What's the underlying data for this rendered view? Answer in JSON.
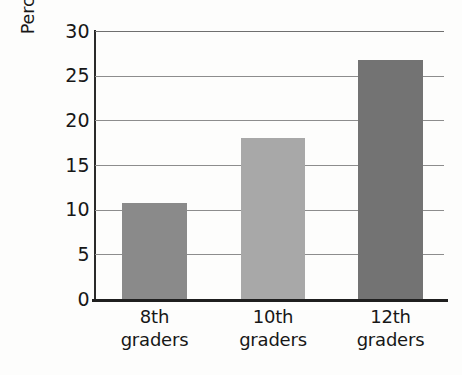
{
  "chart_data": {
    "type": "bar",
    "title": "",
    "subtitle": "",
    "xlabel": "",
    "ylabel": "Percentage smoking regularly",
    "categories": [
      "8th graders",
      "10th graders",
      "12th graders"
    ],
    "category_lines": [
      {
        "line1": "8th",
        "line2": "graders"
      },
      {
        "line1": "10th",
        "line2": "graders"
      },
      {
        "line1": "12th",
        "line2": "graders"
      }
    ],
    "values": [
      10.7,
      18.0,
      26.7
    ],
    "bar_colors": [
      "#8a8a8a",
      "#a8a8a8",
      "#737373"
    ],
    "ylim": [
      0,
      30
    ],
    "ytick_labels": [
      "30",
      "25",
      "20",
      "15",
      "10",
      "5",
      "0"
    ],
    "ytick_values": [
      30,
      25,
      20,
      15,
      10,
      5,
      0
    ],
    "grid": "horizontal",
    "legend": "none",
    "gridline_color": "#8d8d8d",
    "axis_color": "#1f1f1f",
    "background": "#fdfdfc"
  }
}
